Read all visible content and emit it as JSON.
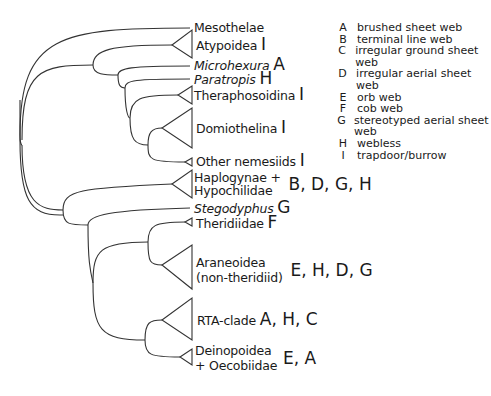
{
  "diagram": {
    "type": "phylogenetic-tree",
    "title": "",
    "taxa": [
      {
        "name": "Mesothelae",
        "italic": false,
        "codes": ""
      },
      {
        "name": "Atypoidea",
        "italic": false,
        "codes": "I"
      },
      {
        "name": "Microhexura",
        "italic": true,
        "codes": "A"
      },
      {
        "name": "Paratropis",
        "italic": true,
        "codes": "H"
      },
      {
        "name": "Theraphosoidina",
        "italic": false,
        "codes": "I"
      },
      {
        "name": "Domiothelina",
        "italic": false,
        "codes": "I"
      },
      {
        "name": "Other nemesiids",
        "italic": false,
        "codes": "I"
      },
      {
        "name": "Haplogynae +",
        "name2": "Hypochilidae",
        "italic": false,
        "codes": "B, D, G, H"
      },
      {
        "name": "Stegodyphus",
        "italic": true,
        "codes": "G"
      },
      {
        "name": "Theridiidae",
        "italic": false,
        "codes": "F"
      },
      {
        "name": "Araneoidea",
        "name2": "(non-theridiid)",
        "italic": false,
        "codes": "E, H, D, G"
      },
      {
        "name": "RTA-clade",
        "italic": false,
        "codes": "A, H, C"
      },
      {
        "name": "Deinopoidea",
        "name2": "+ Oecobiidae",
        "italic": false,
        "codes": "E, A"
      }
    ]
  },
  "legend": [
    {
      "key": "A",
      "desc": "brushed sheet web"
    },
    {
      "key": "B",
      "desc": "terminal line web"
    },
    {
      "key": "C",
      "desc": "irregular ground sheet web"
    },
    {
      "key": "D",
      "desc": "irregular aerial sheet web"
    },
    {
      "key": "E",
      "desc": "orb web"
    },
    {
      "key": "F",
      "desc": "cob web"
    },
    {
      "key": "G",
      "desc": "stereotyped aerial sheet web"
    },
    {
      "key": "H",
      "desc": "webless"
    },
    {
      "key": "I",
      "desc": "trapdoor/burrow"
    }
  ],
  "colors": {
    "line": "#333333",
    "text": "#1a1a1a",
    "background": "#ffffff"
  }
}
